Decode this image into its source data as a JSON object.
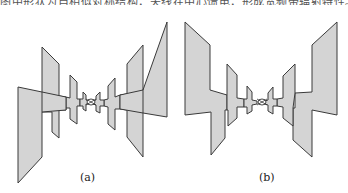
{
  "header": {
    "cropped_text": "图中形状为自相似对称结构，天线在中心馈电，形成宽频带辐射特性。"
  },
  "figures": [
    {
      "id": "a",
      "caption": "(a)",
      "description": "tapered multi-arm bowtie-like antenna, variant a"
    },
    {
      "id": "b",
      "caption": "(b)",
      "description": "tapered multi-arm bowtie-like antenna, variant b"
    }
  ],
  "colors": {
    "fill": "#d4d4d4",
    "stroke": "#3a3a3a",
    "background": "#ffffff"
  }
}
